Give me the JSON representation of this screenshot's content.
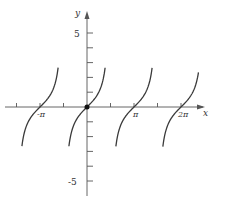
{
  "chart_data": {
    "type": "line",
    "title": "",
    "function": "y = tan(x)",
    "xlabel": "x",
    "ylabel": "y",
    "x_tick_labels": [
      "-π",
      "π",
      "2π"
    ],
    "x_tick_values": [
      -3.14159,
      3.14159,
      6.28318
    ],
    "y_tick_labels": [
      "5",
      "-5"
    ],
    "y_tick_values": [
      5,
      -5
    ],
    "y_minor_ticks": [
      -5,
      -4,
      -3,
      -2,
      -1,
      1,
      2,
      3,
      4,
      5
    ],
    "xlim": [
      -5.8,
      7.2
    ],
    "ylim": [
      -6.5,
      6.5
    ],
    "grid": false,
    "legend": null,
    "highlighted_point": {
      "x": 0,
      "y": 0
    },
    "branches": [
      {
        "x_range": [
          -4.35,
          -1.93
        ],
        "center": -3.14159
      },
      {
        "x_range": [
          -1.21,
          1.21
        ],
        "center": 0
      },
      {
        "x_range": [
          1.93,
          4.35
        ],
        "center": 3.14159
      },
      {
        "x_range": [
          5.07,
          7.45
        ],
        "center": 6.28318
      }
    ],
    "colors": {
      "curve": "#3a3a3a",
      "axis": "#555555"
    }
  },
  "labels": {
    "x_axis": "x",
    "y_axis": "y",
    "neg_pi": "-π",
    "pi": "π",
    "two_pi": "2π",
    "y_pos5": "5",
    "y_neg5": "-5"
  }
}
